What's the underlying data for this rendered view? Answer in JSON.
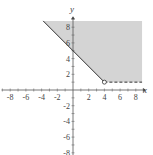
{
  "chart_data": {
    "type": "area",
    "title": "",
    "xlabel": "x",
    "ylabel": "y",
    "xlim": [
      -9,
      9
    ],
    "ylim": [
      -9,
      9
    ],
    "x_ticks": [
      -8,
      -6,
      -4,
      -2,
      2,
      4,
      6,
      8
    ],
    "y_ticks": [
      -8,
      -6,
      -4,
      -2,
      2,
      4,
      6,
      8
    ],
    "grid": false,
    "legend": null,
    "shaded_region": {
      "description": "y >= 5 - x and y > 1 (region above boundary, shaded gray)",
      "fill_color": "#d4d4d4",
      "vertices": [
        [
          -3.8,
          8.8
        ],
        [
          8.8,
          8.8
        ],
        [
          8.8,
          1
        ],
        [
          4,
          1
        ]
      ]
    },
    "boundaries": [
      {
        "name": "y = 5 - x",
        "style": "solid",
        "from": [
          -3.8,
          8.8
        ],
        "to": [
          4,
          1
        ]
      },
      {
        "name": "y = 1",
        "style": "dashed",
        "from": [
          4,
          1
        ],
        "to": [
          8.8,
          1
        ]
      }
    ],
    "points": [
      {
        "x": 4,
        "y": 1,
        "marker": "open-circle"
      }
    ]
  },
  "labels": {
    "x_axis": "x",
    "y_axis": "y",
    "x_ticks": [
      "-8",
      "-6",
      "-4",
      "-2",
      "2",
      "4",
      "6",
      "8"
    ],
    "y_ticks_pos": [
      "2",
      "4",
      "6",
      "8"
    ],
    "y_ticks_neg": [
      "-2",
      "-4",
      "-6",
      "-8"
    ]
  }
}
